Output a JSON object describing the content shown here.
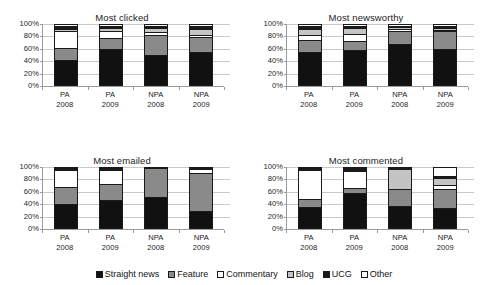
{
  "figure": {
    "width": 488,
    "height": 285,
    "background": "#ffffff"
  },
  "legend": {
    "position": "bottom-center",
    "items": [
      {
        "label": "Straight news",
        "color": "#111111"
      },
      {
        "label": "Feature",
        "color": "#8a8a8a"
      },
      {
        "label": "Commentary",
        "color": "#ffffff"
      },
      {
        "label": "Blog",
        "color": "#c4c4c4"
      },
      {
        "label": "UCG",
        "color": "#1a1a1a"
      },
      {
        "label": "Other",
        "color": "#ffffff"
      }
    ]
  },
  "axis": {
    "yticks": [
      "0%",
      "20%",
      "40%",
      "60%",
      "80%",
      "100%"
    ],
    "ylim": [
      0,
      100
    ],
    "categories": [
      {
        "line1": "PA",
        "line2": "2008"
      },
      {
        "line1": "PA",
        "line2": "2009"
      },
      {
        "line1": "NPA",
        "line2": "2008"
      },
      {
        "line1": "NPA",
        "line2": "2009"
      }
    ]
  },
  "chart_data": [
    {
      "type": "bar",
      "stacked": true,
      "normalized": true,
      "title": "Most clicked",
      "xlabel": "",
      "ylabel": "",
      "ylim": [
        0,
        100
      ],
      "ytick_labels": [
        "0%",
        "20%",
        "40%",
        "60%",
        "80%",
        "100%"
      ],
      "grid": true,
      "categories": [
        "PA 2008",
        "PA 2009",
        "NPA 2008",
        "NPA 2009"
      ],
      "series": [
        {
          "name": "Straight news",
          "color": "#111111",
          "values": [
            40,
            58,
            49,
            54
          ]
        },
        {
          "name": "Feature",
          "color": "#8a8a8a",
          "values": [
            20,
            19,
            32,
            24
          ]
        },
        {
          "name": "Commentary",
          "color": "#ffffff",
          "values": [
            28,
            12,
            5,
            4
          ]
        },
        {
          "name": "Blog",
          "color": "#c4c4c4",
          "values": [
            4,
            4,
            8,
            10
          ]
        },
        {
          "name": "UCG",
          "color": "#1a1a1a",
          "values": [
            4,
            3,
            3,
            4
          ]
        },
        {
          "name": "Other",
          "color": "#ffffff",
          "values": [
            4,
            4,
            3,
            4
          ]
        }
      ]
    },
    {
      "type": "bar",
      "stacked": true,
      "normalized": true,
      "title": "Most newsworthy",
      "xlabel": "",
      "ylabel": "",
      "ylim": [
        0,
        100
      ],
      "ytick_labels": [
        "0%",
        "20%",
        "40%",
        "60%",
        "80%",
        "100%"
      ],
      "grid": true,
      "categories": [
        "PA 2008",
        "PA 2009",
        "NPA 2008",
        "NPA 2009"
      ],
      "series": [
        {
          "name": "Straight news",
          "color": "#111111",
          "values": [
            53,
            57,
            67,
            59
          ]
        },
        {
          "name": "Feature",
          "color": "#8a8a8a",
          "values": [
            20,
            15,
            22,
            29
          ]
        },
        {
          "name": "Commentary",
          "color": "#ffffff",
          "values": [
            9,
            12,
            2,
            2
          ]
        },
        {
          "name": "Blog",
          "color": "#c4c4c4",
          "values": [
            9,
            9,
            4,
            4
          ]
        },
        {
          "name": "UCG",
          "color": "#1a1a1a",
          "values": [
            5,
            4,
            2,
            3
          ]
        },
        {
          "name": "Other",
          "color": "#ffffff",
          "values": [
            4,
            3,
            3,
            3
          ]
        }
      ]
    },
    {
      "type": "bar",
      "stacked": true,
      "normalized": true,
      "title": "Most emailed",
      "xlabel": "",
      "ylabel": "",
      "ylim": [
        0,
        100
      ],
      "ytick_labels": [
        "0%",
        "20%",
        "40%",
        "60%",
        "80%",
        "100%"
      ],
      "grid": true,
      "categories": [
        "PA 2008",
        "PA 2009",
        "NPA 2008",
        "NPA 2009"
      ],
      "series": [
        {
          "name": "Straight news",
          "color": "#111111",
          "values": [
            39,
            45,
            50,
            27
          ]
        },
        {
          "name": "Feature",
          "color": "#8a8a8a",
          "values": [
            29,
            28,
            48,
            64
          ]
        },
        {
          "name": "Commentary",
          "color": "#ffffff",
          "values": [
            28,
            23,
            0,
            7
          ]
        },
        {
          "name": "Blog",
          "color": "#c4c4c4",
          "values": [
            1,
            1,
            0,
            0
          ]
        },
        {
          "name": "UCG",
          "color": "#1a1a1a",
          "values": [
            1,
            1,
            2,
            1
          ]
        },
        {
          "name": "Other",
          "color": "#ffffff",
          "values": [
            2,
            2,
            0,
            1
          ]
        }
      ]
    },
    {
      "type": "bar",
      "stacked": true,
      "normalized": true,
      "title": "Most commented",
      "xlabel": "",
      "ylabel": "",
      "ylim": [
        0,
        100
      ],
      "ytick_labels": [
        "0%",
        "20%",
        "40%",
        "60%",
        "80%",
        "100%"
      ],
      "grid": true,
      "categories": [
        "PA 2008",
        "PA 2009",
        "NPA 2008",
        "NPA 2009"
      ],
      "series": [
        {
          "name": "Straight news",
          "color": "#111111",
          "values": [
            34,
            57,
            35,
            31
          ]
        },
        {
          "name": "Feature",
          "color": "#8a8a8a",
          "values": [
            13,
            8,
            28,
            33
          ]
        },
        {
          "name": "Commentary",
          "color": "#ffffff",
          "values": [
            49,
            28,
            0,
            6
          ]
        },
        {
          "name": "Blog",
          "color": "#c4c4c4",
          "values": [
            1,
            2,
            34,
            11
          ]
        },
        {
          "name": "UCG",
          "color": "#1a1a1a",
          "values": [
            2,
            3,
            2,
            4
          ]
        },
        {
          "name": "Other",
          "color": "#ffffff",
          "values": [
            1,
            2,
            1,
            15
          ]
        }
      ]
    }
  ]
}
